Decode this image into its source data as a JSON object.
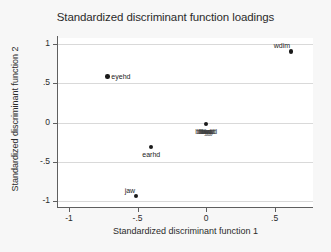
{
  "chart_data": {
    "type": "scatter",
    "title": "Standardized discriminant function loadings",
    "xlabel": "Standardized discriminant function 1",
    "ylabel": "Standardized discriminant function 2",
    "xlim": [
      -1.08,
      0.78
    ],
    "ylim": [
      -1.08,
      1.08
    ],
    "xticks": [
      -1,
      -0.5,
      0,
      0.5
    ],
    "xticklabels": [
      "-1",
      "-.5",
      "0",
      ".5"
    ],
    "yticks": [
      1,
      0.5,
      0,
      -0.5,
      -1
    ],
    "yticklabels": [
      "1",
      ".5",
      "0",
      "-.5",
      "-1"
    ],
    "grid": "horizontal",
    "legend": "none",
    "points": [
      {
        "label": "wdim",
        "x": 0.62,
        "y": 0.91,
        "label_pos": "above-left"
      },
      {
        "label": "eyehd",
        "x": -0.72,
        "y": 0.59,
        "label_pos": "right"
      },
      {
        "label": "cluster",
        "x": 0.0,
        "y": -0.02,
        "label_pos": "below"
      },
      {
        "label": "earhd",
        "x": -0.4,
        "y": -0.31,
        "label_pos": "below"
      },
      {
        "label": "jaw",
        "x": -0.51,
        "y": -0.94,
        "label_pos": "above-left"
      }
    ],
    "cluster_label": "blwyd"
  }
}
